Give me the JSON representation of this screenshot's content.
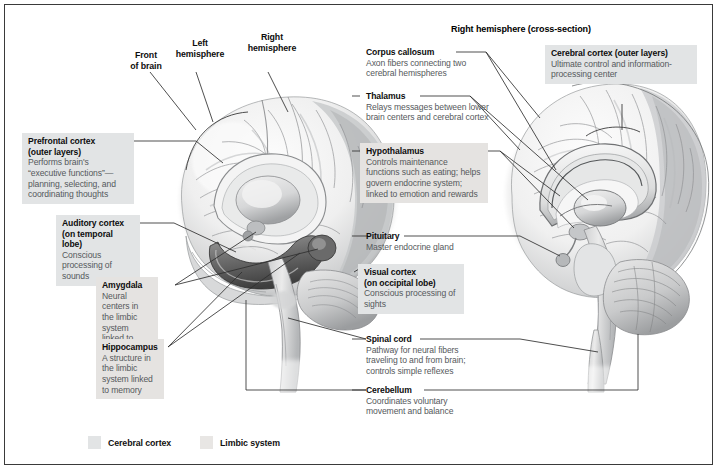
{
  "figure": {
    "section_header": "Right hemisphere (cross-section)"
  },
  "pointers": [
    {
      "id": "front-of-brain",
      "line1": "Front",
      "line2": "of brain"
    },
    {
      "id": "left-hemisphere",
      "line1": "Left",
      "line2": "hemisphere"
    },
    {
      "id": "right-hemisphere",
      "line1": "Right",
      "line2": "hemisphere"
    }
  ],
  "callouts": [
    {
      "id": "prefrontal-cortex",
      "title": "Prefrontal cortex",
      "subtitle": "(outer layers)",
      "body": "Performs brain's “executive functions”—planning, selecting, and coordinating thoughts",
      "group": "cortex"
    },
    {
      "id": "auditory-cortex",
      "title": "Auditory cortex",
      "subtitle": "(on temporal lobe)",
      "body": "Conscious processing of sounds",
      "group": "cortex"
    },
    {
      "id": "amygdala",
      "title": "Amygdala",
      "subtitle": "",
      "body": "Neural centers in the limbic system linked to emotion",
      "group": "limbic"
    },
    {
      "id": "hippocampus",
      "title": "Hippocampus",
      "subtitle": "",
      "body": "A structure in the limbic system linked to memory",
      "group": "limbic"
    },
    {
      "id": "corpus-callosum",
      "title": "Corpus callosum",
      "subtitle": "",
      "body": "Axon fibers connecting two cerebral hemispheres",
      "group": "plain"
    },
    {
      "id": "thalamus",
      "title": "Thalamus",
      "subtitle": "",
      "body": "Relays messages between lower brain centers and cerebral cortex",
      "group": "plain"
    },
    {
      "id": "hypothalamus",
      "title": "Hypothalamus",
      "subtitle": "",
      "body": "Controls maintenance functions such as eating; helps govern endocrine system; linked to emotion and rewards",
      "group": "limbic"
    },
    {
      "id": "pituitary",
      "title": "Pituitary",
      "subtitle": "",
      "body": "Master endocrine gland",
      "group": "plain"
    },
    {
      "id": "visual-cortex",
      "title": "Visual cortex",
      "subtitle": "(on occipital lobe)",
      "body": "Conscious processing of sights",
      "group": "cortex"
    },
    {
      "id": "spinal-cord",
      "title": "Spinal cord",
      "subtitle": "",
      "body": "Pathway for neural fibers traveling to and from brain; controls simple reflexes",
      "group": "plain"
    },
    {
      "id": "cerebellum",
      "title": "Cerebellum",
      "subtitle": "",
      "body": "Coordinates voluntary movement and balance",
      "group": "plain"
    },
    {
      "id": "cerebral-cortex",
      "title": "Cerebral cortex (outer layers)",
      "subtitle": "",
      "body": "Ultimate control and information-processing center",
      "group": "cortex"
    }
  ],
  "legend": {
    "items": [
      {
        "id": "legend-cerebral-cortex",
        "label": "Cerebral cortex",
        "color": "#e2e4e5"
      },
      {
        "id": "legend-limbic-system",
        "label": "Limbic system",
        "color": "#e8e6e4"
      }
    ]
  },
  "colors": {
    "frame_border": "#3a3a3a",
    "cortex_box": "#e2e4e5",
    "limbic_box": "#e5e3e1",
    "leader_line": "#2f2f2f",
    "body_text": "#55595c",
    "title_text": "#0d0d0d"
  }
}
